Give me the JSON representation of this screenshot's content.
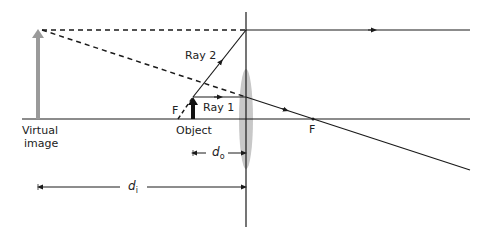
{
  "diagram": {
    "type": "converging-lens-ray-diagram",
    "labels": {
      "ray1": "Ray 1",
      "ray2": "Ray 2",
      "focal_left": "F",
      "focal_right": "F",
      "object": "Object",
      "virtual_image_line1": "Virtual",
      "virtual_image_line2": "image",
      "d_object": "d",
      "d_object_sub": "o",
      "d_image": "d",
      "d_image_sub": "i"
    },
    "colors": {
      "line": "#1a1a1a",
      "lens": "#c8c8c8",
      "virtual_image": "#9a9a9a",
      "object": "#111111"
    }
  }
}
